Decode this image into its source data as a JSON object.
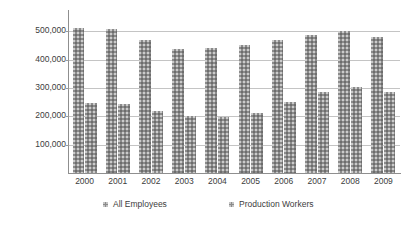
{
  "chart_data": {
    "type": "bar",
    "title": "",
    "subtitle": "",
    "xlabel": "",
    "ylabel": "Employees",
    "categories": [
      "2000",
      "2001",
      "2002",
      "2003",
      "2004",
      "2005",
      "2006",
      "2007",
      "2008",
      "2009"
    ],
    "series": [
      {
        "name": "All Employees",
        "color": "#8b8b8b",
        "values": [
          513000,
          508000,
          470000,
          437000,
          441000,
          452000,
          470000,
          486000,
          501000,
          481000
        ]
      },
      {
        "name": "Production Workers",
        "color": "#8b8b8b",
        "values": [
          246000,
          243000,
          220000,
          200000,
          199000,
          212000,
          251000,
          285000,
          302000,
          287000
        ]
      }
    ],
    "ylim": [
      0,
      575000
    ],
    "y_ticks": [
      100000,
      200000,
      300000,
      400000,
      500000
    ],
    "y_tick_labels": [
      "100,000",
      "200,000",
      "300,000",
      "400,000",
      "500,000"
    ],
    "grid": true,
    "grid_axis": "y",
    "legend_position": "bottom"
  },
  "legend": {
    "entries": [
      {
        "label": "All Employees"
      },
      {
        "label": "Production Workers"
      }
    ]
  }
}
